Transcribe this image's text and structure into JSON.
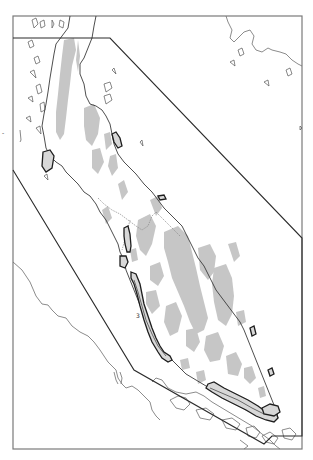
{
  "map": {
    "region": "Malay Peninsula",
    "colors": {
      "frame": "#7a7a7a",
      "coastline": "#6e6e6e",
      "highland_shading": "#c6c6c6",
      "study_area_boundary": "#2b2b2b",
      "wetland_outline": "#1e1e1e",
      "background": "#ffffff"
    },
    "labels": {
      "area_3": "3",
      "edge_tick": "-"
    },
    "legend_items": [
      {
        "symbol": "gray-fill",
        "meaning": "highland"
      },
      {
        "symbol": "bold-outline",
        "meaning": "coastal-wetland-patch"
      },
      {
        "symbol": "black-polygon",
        "meaning": "study-area-boundary"
      }
    ]
  }
}
